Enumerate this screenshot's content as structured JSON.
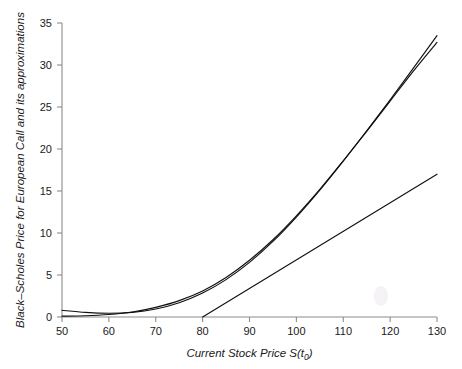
{
  "chart_data": {
    "type": "line",
    "title": "",
    "xlabel": "Current Stock Price S(t0)",
    "xlabel_main": "Current Stock Price S(t",
    "xlabel_sub": "0",
    "xlabel_tail": ")",
    "ylabel": "Black–Scholes Price for European Call and its approximations",
    "xlim": [
      50,
      130
    ],
    "ylim": [
      0,
      35
    ],
    "xticks": [
      50,
      60,
      70,
      80,
      90,
      100,
      110,
      120,
      130
    ],
    "yticks": [
      0,
      5,
      10,
      15,
      20,
      25,
      30,
      35
    ],
    "xtick_labels": [
      "50",
      "60",
      "70",
      "80",
      "90",
      "100",
      "110",
      "120",
      "130"
    ],
    "ytick_labels": [
      "0",
      "5",
      "10",
      "15",
      "20",
      "25",
      "30",
      "35"
    ],
    "grid": false,
    "legend": "none",
    "x": [
      50,
      55,
      60,
      65,
      70,
      75,
      80,
      85,
      90,
      95,
      100,
      105,
      110,
      115,
      120,
      125,
      130
    ],
    "series": [
      {
        "name": "Black-Scholes price",
        "color": "#111111",
        "values": [
          0.8,
          0.55,
          0.45,
          0.55,
          0.95,
          1.7,
          2.85,
          4.45,
          6.5,
          9.0,
          11.9,
          15.1,
          18.55,
          22.15,
          25.85,
          29.65,
          33.5
        ]
      },
      {
        "name": "approximation 1",
        "color": "#111111",
        "values": [
          0.1,
          0.15,
          0.3,
          0.6,
          1.15,
          1.95,
          3.1,
          4.7,
          6.75,
          9.2,
          12.05,
          15.2,
          18.6,
          22.1,
          25.7,
          29.3,
          32.7
        ]
      },
      {
        "name": "intrinsic value / linear approximation",
        "color": "#111111",
        "values": [
          null,
          null,
          null,
          null,
          null,
          null,
          0.0,
          1.7,
          3.4,
          5.1,
          6.8,
          8.5,
          10.2,
          11.9,
          13.6,
          15.3,
          17.0
        ]
      }
    ],
    "line_segment": {
      "name": "straight-line approximation",
      "x0": 80,
      "y0": 0.0,
      "x1": 130,
      "y1": 27.0
    }
  },
  "axes": {
    "x_axis_name": "x-axis",
    "y_axis_name": "y-axis"
  }
}
